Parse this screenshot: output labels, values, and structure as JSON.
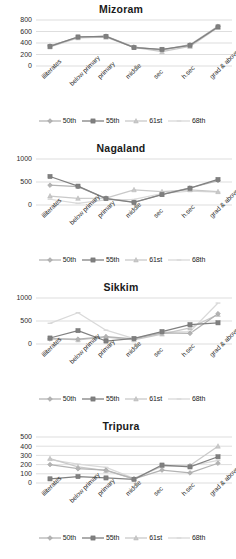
{
  "page": {
    "series_names": [
      "50th",
      "55th",
      "61st",
      "68th"
    ],
    "series_colors": [
      "#b3b3b3",
      "#808080",
      "#c9c9c9",
      "#d9d9d9"
    ],
    "series_markers": [
      "diamond",
      "square",
      "triangle",
      "dash"
    ],
    "categories": [
      "illiterates",
      "below primary",
      "primary",
      "middle",
      "sec",
      "h.sec",
      "grad & above"
    ]
  },
  "charts": [
    {
      "id": "mizoram",
      "title": "Mizoram",
      "chart_data": {
        "type": "line",
        "title": "Mizoram",
        "xlabel": "",
        "ylabel": "",
        "ylim": [
          0,
          800
        ],
        "yticks": [
          0,
          200,
          400,
          600,
          800
        ],
        "grid": true,
        "legend_position": "bottom",
        "categories": [
          "illiterates",
          "below primary",
          "primary",
          "middle",
          "sec",
          "h.sec",
          "grad & above"
        ],
        "series": [
          {
            "name": "50th",
            "values": [
              350,
              500,
              520,
              330,
              280,
              370,
              690
            ]
          },
          {
            "name": "55th",
            "values": [
              340,
              505,
              515,
              320,
              290,
              360,
              680
            ]
          },
          {
            "name": "61st",
            "values": [
              330,
              490,
              500,
              325,
              250,
              340,
              670
            ]
          },
          {
            "name": "68th",
            "values": [
              345,
              495,
              510,
              330,
              270,
              355,
              685
            ]
          }
        ]
      }
    },
    {
      "id": "nagaland",
      "title": "Nagaland",
      "chart_data": {
        "type": "line",
        "title": "Nagaland",
        "xlabel": "",
        "ylabel": "",
        "ylim": [
          0,
          1000
        ],
        "yticks": [
          0,
          500,
          1000
        ],
        "grid": true,
        "legend_position": "bottom",
        "categories": [
          "illiterates",
          "below primary",
          "primary",
          "middle",
          "sec",
          "h.sec",
          "grad & above"
        ],
        "series": [
          {
            "name": "50th",
            "values": [
              430,
              400,
              145,
              60,
              230,
              370,
              530
            ]
          },
          {
            "name": "55th",
            "values": [
              620,
              410,
              140,
              55,
              225,
              365,
              555
            ]
          },
          {
            "name": "61st",
            "values": [
              195,
              145,
              150,
              330,
              290,
              330,
              290
            ]
          },
          {
            "name": "68th",
            "values": [
              125,
              35,
              110,
              120,
              250,
              300,
              280
            ]
          }
        ]
      }
    },
    {
      "id": "sikkim",
      "title": "Sikkim",
      "chart_data": {
        "type": "line",
        "title": "Sikkim",
        "xlabel": "",
        "ylabel": "",
        "ylim": [
          0,
          1000
        ],
        "yticks": [
          0,
          500,
          1000
        ],
        "grid": true,
        "legend_position": "bottom",
        "categories": [
          "illiterates",
          "below primary",
          "primary",
          "middle",
          "sec",
          "h.sec",
          "grad & above"
        ],
        "series": [
          {
            "name": "50th",
            "values": [
              110,
              105,
              160,
              110,
              240,
              230,
              660
            ]
          },
          {
            "name": "55th",
            "values": [
              130,
              290,
              65,
              120,
              270,
              420,
              460
            ]
          },
          {
            "name": "61st",
            "values": [
              120,
              90,
              150,
              90,
              215,
              350,
              640
            ]
          },
          {
            "name": "68th",
            "values": [
              450,
              680,
              300,
              115,
              260,
              270,
              890
            ]
          }
        ]
      }
    },
    {
      "id": "tripura",
      "title": "Tripura",
      "chart_data": {
        "type": "line",
        "title": "Tripura",
        "xlabel": "",
        "ylabel": "",
        "ylim": [
          0,
          500
        ],
        "yticks": [
          0,
          100,
          200,
          300,
          400,
          500
        ],
        "grid": true,
        "legend_position": "bottom",
        "categories": [
          "illiterates",
          "below primary",
          "primary",
          "middle",
          "sec",
          "h.sec",
          "grad & above"
        ],
        "series": [
          {
            "name": "50th",
            "values": [
              200,
              155,
              140,
              45,
              140,
              110,
              215
            ]
          },
          {
            "name": "55th",
            "values": [
              45,
              70,
              55,
              40,
              195,
              175,
              285
            ]
          },
          {
            "name": "61st",
            "values": [
              265,
              175,
              135,
              45,
              185,
              190,
              400
            ]
          },
          {
            "name": "68th",
            "values": [
              255,
              205,
              170,
              50,
              180,
              185,
              245
            ]
          }
        ]
      }
    }
  ]
}
